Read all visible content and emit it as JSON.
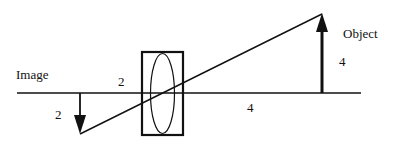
{
  "diagram": {
    "type": "thin-lens ray diagram",
    "labels": {
      "image": "Image",
      "object": "Object",
      "image_height": "2",
      "image_distance": "2",
      "object_height": "4",
      "object_distance": "4"
    },
    "colors": {
      "line": "#111111",
      "background": "#ffffff"
    }
  }
}
